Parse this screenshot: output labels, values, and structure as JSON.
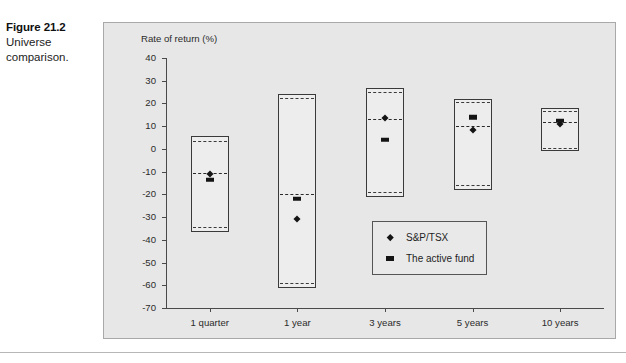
{
  "caption": {
    "figure_number": "Figure 21.2",
    "title": "Universe comparison."
  },
  "chart_data": {
    "type": "box",
    "title": "",
    "subtitle": "",
    "xlabel": "",
    "ylabel": "Rate of return (%)",
    "ylim": [
      -70,
      40
    ],
    "ytick_values": [
      40,
      30,
      20,
      10,
      0,
      -10,
      -20,
      -30,
      -40,
      -50,
      -60,
      -70
    ],
    "ytick_labels": [
      "40",
      "30",
      "20",
      "10",
      "0",
      "-10",
      "-20",
      "-30",
      "-40",
      "-50",
      "-60",
      "-70"
    ],
    "categories": [
      "1 quarter",
      "1 year",
      "3 years",
      "5 years",
      "10 years"
    ],
    "grid": false,
    "legend_position": "inside-lower-right",
    "legend": [
      {
        "name": "S&P/TSX",
        "marker": "diamond"
      },
      {
        "name": "The active fund",
        "marker": "square"
      }
    ],
    "boxes": [
      {
        "category": "1 quarter",
        "top": 5.5,
        "upper_quartile": 3.7,
        "median": -10.5,
        "lower_quartile": -34.5,
        "bottom": -36.5
      },
      {
        "category": "1 year",
        "top": 24.0,
        "upper_quartile": 22.5,
        "median": -20.0,
        "lower_quartile": -59.0,
        "bottom": -61.0
      },
      {
        "category": "3 years",
        "top": 27.0,
        "upper_quartile": 25.0,
        "median": 13.0,
        "lower_quartile": -19.0,
        "bottom": -21.0
      },
      {
        "category": "5 years",
        "top": 22.0,
        "upper_quartile": 20.5,
        "median": 10.0,
        "lower_quartile": -16.0,
        "bottom": -18.0
      },
      {
        "category": "10 years",
        "top": 18.0,
        "upper_quartile": 16.5,
        "median": 12.0,
        "lower_quartile": 0.5,
        "bottom": -1.0
      }
    ],
    "series": [
      {
        "name": "S&P/TSX",
        "marker": "diamond",
        "values": [
          -11.0,
          -31.0,
          13.5,
          8.5,
          11.0
        ]
      },
      {
        "name": "The active fund",
        "marker": "square",
        "values": [
          -13.5,
          -22.0,
          4.0,
          14.0,
          12.5
        ]
      }
    ]
  },
  "colors": {
    "panel_background": "#e7e7e7",
    "box_fill": "#ededed",
    "box_stroke": "#3a3a3a",
    "marker": "#141414",
    "axis": "#4a4a4a",
    "text": "#2b2b2b"
  }
}
